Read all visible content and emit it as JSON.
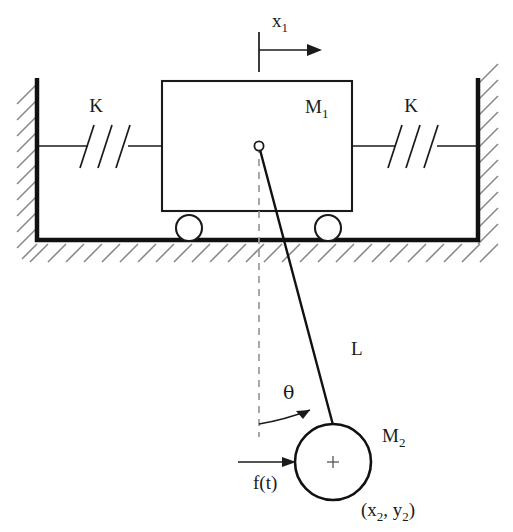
{
  "figure": {
    "type": "mechanical-system-schematic",
    "background_color": "#ffffff",
    "line_color": "#1a1a1a",
    "hatch_color": "#8a8a8a",
    "dash_color": "#9a9a9a"
  },
  "labels": {
    "displacement": "x",
    "displacement_sub": "1",
    "spring_left": "K",
    "spring_right": "K",
    "cart_mass": "M",
    "cart_mass_sub": "1",
    "rod_length": "L",
    "angle": "θ",
    "ball_mass": "M",
    "ball_mass_sub": "2",
    "force": "f(t)",
    "coordinates_open": "(x",
    "coordinates_sub1": "2",
    "coordinates_mid": ", y",
    "coordinates_sub2": "2",
    "coordinates_close": ")"
  },
  "components": {
    "left_wall": {
      "name": "fixed-left-wall",
      "x": 37,
      "y_top": 78,
      "y_bottom": 242
    },
    "right_wall": {
      "name": "fixed-right-wall",
      "x": 478,
      "y_top": 78,
      "y_bottom": 242
    },
    "floor": {
      "name": "ground-surface",
      "y": 240,
      "x_left": 37,
      "x_right": 478
    },
    "cart": {
      "name": "cart-body-M1",
      "x": 162,
      "y": 81,
      "width": 190,
      "height": 130
    },
    "wheel_left": {
      "name": "cart-wheel-left",
      "cx": 189,
      "cy": 228,
      "r": 13
    },
    "wheel_right": {
      "name": "cart-wheel-right",
      "cx": 328,
      "cy": 228,
      "r": 13
    },
    "pivot": {
      "name": "pendulum-pivot",
      "cx": 259,
      "cy": 146,
      "r": 4.5
    },
    "rod": {
      "name": "pendulum-rod-L",
      "x1": 259,
      "y1": 146,
      "x2": 332,
      "y2": 424
    },
    "ball": {
      "name": "pendulum-bob-M2",
      "cx": 333,
      "cy": 462,
      "r": 38
    },
    "spring_left": {
      "name": "spring-left-K",
      "x_start": 37,
      "x_end": 162,
      "y": 146
    },
    "spring_right": {
      "name": "spring-right-K",
      "x_start": 352,
      "x_end": 478,
      "y": 146
    },
    "force_arrow": {
      "name": "applied-force-arrow",
      "x_start": 238,
      "x_end": 294,
      "y": 462
    },
    "displacement_arrow": {
      "name": "displacement-arrow-x1",
      "x_start": 259,
      "x_end": 321,
      "y": 45
    },
    "angle_arc": {
      "name": "angle-arc-theta",
      "center_x": 259,
      "center_y": 146,
      "radius": 278
    },
    "dashed_vertical": {
      "name": "vertical-reference-line",
      "x": 259,
      "y_top": 146,
      "y_bottom": 437
    }
  }
}
